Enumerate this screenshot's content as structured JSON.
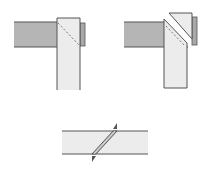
{
  "diagram": {
    "colors": {
      "background": "#ffffff",
      "dark_strip": "#b3b3b3",
      "light_strip": "#ececec",
      "outline": "#555555",
      "dashed_line": "#777777"
    },
    "figures": [
      {
        "id": "overlap",
        "label": ""
      },
      {
        "id": "cut",
        "label": ""
      },
      {
        "id": "seam",
        "label": ""
      }
    ]
  }
}
